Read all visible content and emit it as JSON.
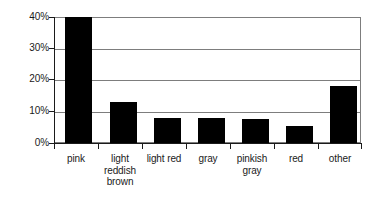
{
  "chart_data": {
    "type": "bar",
    "title": "",
    "subtitle": "",
    "xlabel": "",
    "ylabel": "",
    "categories": [
      "pink",
      "light reddish brown",
      "light red",
      "gray",
      "pinkish gray",
      "red",
      "other"
    ],
    "values": [
      40,
      13,
      8,
      8,
      7.5,
      5.5,
      18
    ],
    "ylim": [
      0,
      40
    ],
    "ytick_values": [
      0,
      10,
      20,
      30,
      40
    ],
    "ytick_labels": [
      "0%",
      "10%",
      "20%",
      "30%",
      "40%"
    ],
    "grid": true,
    "legend": false,
    "legend_position": "none",
    "bar_color": "#000000",
    "grid_color": "#7d7d7d",
    "axis_color": "#1a1a1a",
    "background_color": "#ffffff"
  },
  "axes": {
    "y": {
      "ticks": [
        {
          "label": "40%",
          "value": 40
        },
        {
          "label": "30%",
          "value": 30
        },
        {
          "label": "20%",
          "value": 20
        },
        {
          "label": "10%",
          "value": 10
        },
        {
          "label": "0%",
          "value": 0
        }
      ]
    },
    "x": {
      "ticks": [
        {
          "label": "pink",
          "lines": [
            "pink"
          ]
        },
        {
          "label": "light reddish brown",
          "lines": [
            "light",
            "reddish",
            "brown"
          ]
        },
        {
          "label": "light red",
          "lines": [
            "light red"
          ]
        },
        {
          "label": "gray",
          "lines": [
            "gray"
          ]
        },
        {
          "label": "pinkish gray",
          "lines": [
            "pinkish",
            "gray"
          ]
        },
        {
          "label": "red",
          "lines": [
            "red"
          ]
        },
        {
          "label": "other",
          "lines": [
            "other"
          ]
        }
      ]
    }
  }
}
